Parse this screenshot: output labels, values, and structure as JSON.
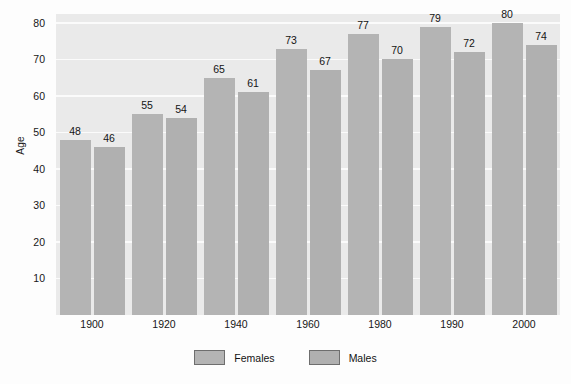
{
  "chart_data": {
    "type": "bar",
    "title": "",
    "xlabel": "",
    "ylabel": "Age",
    "categories": [
      "1900",
      "1920",
      "1940",
      "1960",
      "1980",
      "1990",
      "2000"
    ],
    "series": [
      {
        "name": "Females",
        "values": [
          48,
          55,
          65,
          73,
          77,
          79,
          80
        ]
      },
      {
        "name": "Males",
        "values": [
          46,
          54,
          61,
          67,
          70,
          72,
          74
        ]
      }
    ],
    "ylim": [
      0,
      83
    ],
    "yticks": [
      10,
      20,
      30,
      40,
      50,
      60,
      70,
      80
    ],
    "ytick_labels": [
      "10",
      "20",
      "30",
      "40",
      "50",
      "60",
      "70",
      "80"
    ],
    "grid": true,
    "grid_color": "#fbfbfb",
    "plot_background": "#eaeaea",
    "legend": {
      "position": "bottom",
      "entries": [
        {
          "label": "Females",
          "color": "#b4b4b4"
        },
        {
          "label": "Males",
          "color": "#b0b0b0"
        }
      ]
    },
    "data_labels": [
      {
        "category": "1900",
        "series": "Females",
        "value": "48"
      },
      {
        "category": "1900",
        "series": "Males",
        "value": "46"
      },
      {
        "category": "1920",
        "series": "Females",
        "value": "55"
      },
      {
        "category": "1920",
        "series": "Males",
        "value": "54"
      },
      {
        "category": "1940",
        "series": "Females",
        "value": "65"
      },
      {
        "category": "1940",
        "series": "Males",
        "value": "61"
      },
      {
        "category": "1960",
        "series": "Females",
        "value": "73"
      },
      {
        "category": "1960",
        "series": "Males",
        "value": "67"
      },
      {
        "category": "1980",
        "series": "Females",
        "value": "77"
      },
      {
        "category": "1980",
        "series": "Males",
        "value": "70"
      },
      {
        "category": "1990",
        "series": "Females",
        "value": "79"
      },
      {
        "category": "1990",
        "series": "Males",
        "value": "72"
      },
      {
        "category": "2000",
        "series": "Females",
        "value": "80"
      },
      {
        "category": "2000",
        "series": "Males",
        "value": "74"
      }
    ]
  }
}
